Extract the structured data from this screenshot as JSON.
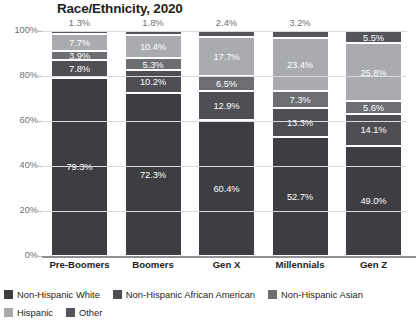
{
  "chart_data": {
    "type": "bar",
    "subtype": "stacked-bar-100",
    "title": "Race/Ethnicity, 2020",
    "xlabel": "",
    "ylabel": "",
    "ylim": [
      0,
      100
    ],
    "ytick_labels": [
      "0%",
      "20%",
      "40%",
      "60%",
      "80%",
      "100%"
    ],
    "ytick_values": [
      0,
      20,
      40,
      60,
      80,
      100
    ],
    "grid": true,
    "legend_position": "bottom-left",
    "categories": [
      "Pre-Boomers",
      "Boomers",
      "Gen X",
      "Millennials",
      "Gen Z"
    ],
    "series": [
      {
        "name": "Non-Hispanic White",
        "color": "#3d3d42",
        "values": [
          79.3,
          72.3,
          60.4,
          52.7,
          49.0
        ],
        "labels": [
          "79.3%",
          "72.3%",
          "60.4%",
          "52.7%",
          "49.0%"
        ],
        "label_inside": [
          true,
          true,
          true,
          true,
          true
        ]
      },
      {
        "name": "Non-Hispanic African American",
        "color": "#4e4e54",
        "values": [
          7.8,
          10.2,
          12.9,
          13.3,
          14.1
        ],
        "labels": [
          "7.8%",
          "10.2%",
          "12.9%",
          "13.3%",
          "14.1%"
        ],
        "label_inside": [
          true,
          true,
          true,
          true,
          true
        ]
      },
      {
        "name": "Non-Hispanic Asian",
        "color": "#6c6e72",
        "values": [
          3.9,
          5.3,
          6.5,
          7.3,
          5.6
        ],
        "labels": [
          "3.9%",
          "5.3%",
          "6.5%",
          "7.3%",
          "5.6%"
        ],
        "label_inside": [
          true,
          true,
          true,
          true,
          true
        ]
      },
      {
        "name": "Hispanic",
        "color": "#a9abae",
        "values": [
          7.7,
          10.4,
          17.7,
          23.4,
          25.8
        ],
        "labels": [
          "7.7%",
          "10.4%",
          "17.7%",
          "23.4%",
          "25.8%"
        ],
        "label_inside": [
          true,
          true,
          true,
          true,
          true
        ]
      },
      {
        "name": "Other",
        "color": "#55565b",
        "values": [
          1.3,
          1.8,
          2.4,
          3.2,
          5.5
        ],
        "labels": [
          "1.3%",
          "1.8%",
          "2.4%",
          "3.2%",
          "5.5%"
        ],
        "label_inside": [
          false,
          false,
          false,
          false,
          true
        ]
      }
    ]
  },
  "legend": {
    "items": [
      {
        "label": "Non-Hispanic White",
        "color": "#3d3d42"
      },
      {
        "label": "Non-Hispanic African American",
        "color": "#4e4e54"
      },
      {
        "label": "Non-Hispanic Asian",
        "color": "#6c6e72"
      },
      {
        "label": "Hispanic",
        "color": "#a9abae"
      },
      {
        "label": "Other",
        "color": "#55565b"
      }
    ]
  }
}
